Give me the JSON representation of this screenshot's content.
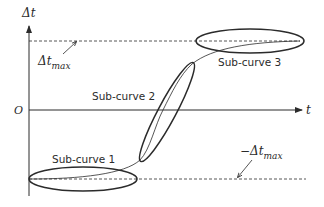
{
  "diagram": {
    "axes": {
      "y_label": "Δt",
      "x_label": "t",
      "origin_label": "O"
    },
    "thresholds": {
      "upper": {
        "symbol": "Δt",
        "subscript": "max"
      },
      "lower": {
        "symbol": "−Δt",
        "subscript": "max"
      }
    },
    "sub_curves": [
      {
        "label": "Sub-curve 1"
      },
      {
        "label": "Sub-curve 2"
      },
      {
        "label": "Sub-curve 3"
      }
    ],
    "colors": {
      "line": "#2b2b2b",
      "background": "#ffffff"
    }
  }
}
